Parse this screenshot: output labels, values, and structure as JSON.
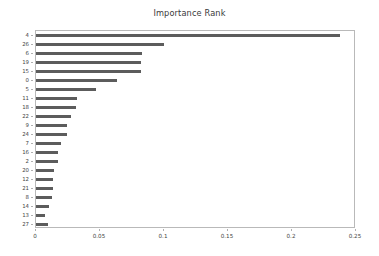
{
  "chart_data": {
    "type": "bar",
    "orientation": "horizontal",
    "title": "Importance Rank",
    "xlabel": "",
    "ylabel": "",
    "xlim": [
      0,
      0.25
    ],
    "xticks": [
      "0",
      "0.05",
      "0.1",
      "0.15",
      "0.2",
      "0.25"
    ],
    "xtick_values": [
      0,
      0.05,
      0.1,
      0.15,
      0.2,
      0.25
    ],
    "grid": false,
    "legend": null,
    "bar_color": "#5c5c5c",
    "categories": [
      "4",
      "26",
      "6",
      "19",
      "15",
      "0",
      "5",
      "11",
      "18",
      "22",
      "9",
      "24",
      "7",
      "16",
      "2",
      "20",
      "12",
      "21",
      "8",
      "14",
      "13",
      "27"
    ],
    "values": [
      0.2375,
      0.1002,
      0.083,
      0.0821,
      0.082,
      0.0633,
      0.0469,
      0.032,
      0.0313,
      0.0273,
      0.0242,
      0.0242,
      0.0195,
      0.0172,
      0.0172,
      0.0141,
      0.0133,
      0.0133,
      0.0125,
      0.0102,
      0.007,
      0.0094
    ]
  }
}
